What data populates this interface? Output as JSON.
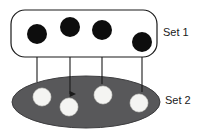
{
  "diagram": {
    "type": "set-mapping-diagram",
    "background_color": "#ffffff",
    "sets": [
      {
        "id": "set1",
        "label": "Set 1",
        "shape": "rounded-rectangle",
        "fill_color": "#ffffff",
        "stroke_color": "#1a1a1a",
        "label_position": "right",
        "label_x": 163,
        "label_y": 33,
        "bounds": {
          "x": 11,
          "y": 10,
          "width": 146,
          "height": 47,
          "rx": 14
        },
        "element_count": 4,
        "element_color": "#0d0d0d",
        "elements": [
          {
            "id": "s1-e1",
            "cx": 37,
            "cy": 34,
            "r": 10
          },
          {
            "id": "s1-e2",
            "cx": 70,
            "cy": 27,
            "r": 10
          },
          {
            "id": "s1-e3",
            "cx": 102,
            "cy": 30,
            "r": 10
          },
          {
            "id": "s1-e4",
            "cx": 142,
            "cy": 42,
            "r": 10
          }
        ]
      },
      {
        "id": "set2",
        "label": "Set 2",
        "shape": "ellipse",
        "fill_color": "#58585a",
        "stroke_color": "#3d3d3f",
        "label_position": "right",
        "label_x": 165,
        "label_y": 101,
        "bounds": {
          "cx": 86,
          "cy": 102,
          "rx": 74,
          "ry": 26
        },
        "element_count": 4,
        "element_color": "#f4f4f2",
        "elements": [
          {
            "id": "s2-e1",
            "cx": 42,
            "cy": 97,
            "r": 9
          },
          {
            "id": "s2-e2",
            "cx": 69,
            "cy": 107,
            "r": 9
          },
          {
            "id": "s2-e3",
            "cx": 103,
            "cy": 95,
            "r": 9
          },
          {
            "id": "s2-e4",
            "cx": 139,
            "cy": 103,
            "r": 9
          }
        ]
      }
    ],
    "connectors": [
      {
        "id": "arrow-1",
        "from": "set2",
        "to": "set1",
        "direction": "up",
        "x": 37,
        "y_start": 82,
        "y_end": 46,
        "color": "#1a1a1a"
      },
      {
        "id": "arrow-2",
        "from": "set1",
        "to": "set2",
        "direction": "down",
        "x": 70,
        "y_start": 38,
        "y_end": 94,
        "color": "#1a1a1a"
      },
      {
        "id": "arrow-3",
        "from": "set2",
        "to": "set1",
        "direction": "up",
        "x": 102,
        "y_start": 84,
        "y_end": 42,
        "color": "#1a1a1a"
      },
      {
        "id": "arrow-4",
        "from": "set2",
        "to": "set1",
        "direction": "up",
        "x": 142,
        "y_start": 92,
        "y_end": 54,
        "color": "#1a1a1a"
      }
    ]
  }
}
